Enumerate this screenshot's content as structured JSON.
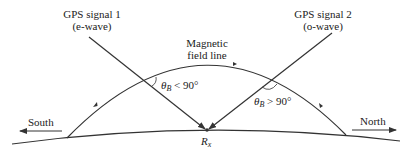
{
  "signal1": {
    "title": "GPS signal 1",
    "subtitle": "(e-wave)"
  },
  "signal2": {
    "title": "GPS signal 2",
    "subtitle": "(o-wave)"
  },
  "field_line": {
    "line1": "Magnetic",
    "line2": "field line"
  },
  "angle1": {
    "symbol": "θ",
    "sub": "B",
    "relation": " < 90°"
  },
  "angle2": {
    "symbol": "θ",
    "sub": "B",
    "relation": " > 90°"
  },
  "receiver": {
    "symbol": "R",
    "sub": "x"
  },
  "direction_left": "South",
  "direction_right": "North",
  "colors": {
    "line": "#333333",
    "text": "#222222",
    "background": "#ffffff"
  }
}
